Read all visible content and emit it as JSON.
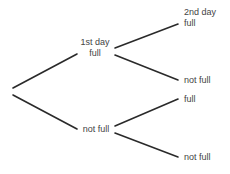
{
  "diagram": {
    "type": "tree",
    "line_color": "#2a2a2a",
    "text_color": "#444444",
    "nodes": {
      "first_day_header": "1st day",
      "first_full": "full",
      "first_not_full": "not full",
      "second_day_header": "2nd day",
      "second_a_full": "full",
      "second_a_not_full": "not full",
      "second_b_full": "full",
      "second_b_not_full": "not full"
    },
    "edges": [
      {
        "from": "root",
        "to": "1st day full"
      },
      {
        "from": "root",
        "to": "not full"
      },
      {
        "from": "1st day full",
        "to": "2nd day full"
      },
      {
        "from": "1st day full",
        "to": "not full"
      },
      {
        "from": "not full",
        "to": "full"
      },
      {
        "from": "not full",
        "to": "not full"
      }
    ]
  }
}
